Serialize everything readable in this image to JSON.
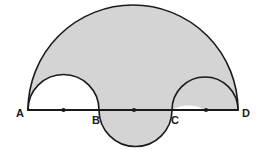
{
  "figure": {
    "colors": {
      "shaded_fill": "#d4d4d4",
      "unshaded_fill": "#ffffff",
      "stroke": "#1a1a1a",
      "background": "#ffffff"
    },
    "baseline": {
      "name": "segment-AD",
      "y": 110,
      "x_start": 28,
      "x_end": 238,
      "stroke_width": 2
    },
    "points": [
      {
        "id": "A",
        "label": "A",
        "x": 28,
        "y": 110,
        "label_x": 20,
        "label_y": 117,
        "marker": false
      },
      {
        "id": "B",
        "label": "B",
        "x": 99,
        "y": 110,
        "label_x": 93,
        "label_y": 123,
        "marker": false
      },
      {
        "id": "C",
        "label": "C",
        "x": 172,
        "y": 110,
        "label_x": 168,
        "label_y": 123,
        "marker": false
      },
      {
        "id": "D",
        "label": "D",
        "x": 238,
        "y": 110,
        "label_x": 242,
        "label_y": 117,
        "marker": false
      }
    ],
    "midpoint_dots": [
      {
        "id": "mid-AB",
        "x": 63.5,
        "y": 110,
        "r": 2.1
      },
      {
        "id": "mid-BC",
        "x": 134,
        "y": 110,
        "r": 2.1
      },
      {
        "id": "mid-CD",
        "x": 206,
        "y": 110,
        "r": 2.1
      }
    ],
    "arcs": [
      {
        "id": "arc-AD-large",
        "name": "large-semicircle-AD",
        "from": "A",
        "to": "D",
        "center_x": 133,
        "radius": 105,
        "side": "above",
        "shaded": true
      },
      {
        "id": "arc-AB-small",
        "name": "small-semicircle-AB",
        "from": "A",
        "to": "B",
        "center_x": 63.5,
        "radius": 35.5,
        "side": "above",
        "shaded": false
      },
      {
        "id": "arc-CD-small",
        "name": "small-semicircle-CD",
        "from": "C",
        "to": "D",
        "center_x": 205,
        "radius": 33,
        "side": "above",
        "shaded": false
      },
      {
        "id": "arc-BC-lower",
        "name": "semicircle-BC-below",
        "from": "B",
        "to": "C",
        "center_x": 135.5,
        "radius": 36.5,
        "side": "below",
        "shaded": true
      }
    ],
    "shaded_region_description": "Large semicircle on AD, minus semicircles on AB and CD, plus semicircle on BC below the line"
  }
}
